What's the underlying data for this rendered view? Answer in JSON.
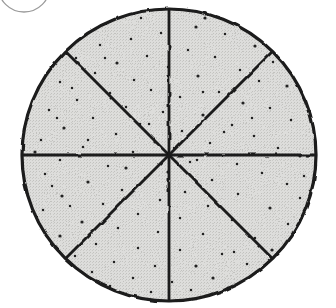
{
  "document": {
    "title": "Fraction Circle Diagram",
    "background_color": "#ffffff",
    "width": 336,
    "height": 308
  },
  "figure": {
    "name": "eighths-pie-circle",
    "description": "Hand-drawn circle divided into eight equal sectors, shaded with a stippled gray texture",
    "ink_color": "#1a1a1a",
    "fill_color": "#d9d9d6",
    "stipple_color": "#222222",
    "outline_width": 3.2,
    "divider_width": 2.8
  },
  "circle": {
    "name": "main-circle",
    "center_x": 169,
    "center_y": 155,
    "radius_x": 147,
    "radius_y": 146,
    "sector_count": 8,
    "sector_fraction": "1/8",
    "divider_angles_deg": [
      0,
      45,
      90,
      135
    ]
  },
  "partial_arc": {
    "name": "cropped-circle-arc",
    "description": "Faint partial circle outline cropped at the upper-left corner of the page",
    "center_x": 24,
    "center_y": -14,
    "radius": 26,
    "color": "#9a9a9a",
    "stroke_width": 1.3
  },
  "stipple_points": [
    [
      196,
      27
    ],
    [
      161,
      33
    ],
    [
      131,
      39
    ],
    [
      225,
      34
    ],
    [
      100,
      45
    ],
    [
      255,
      46
    ],
    [
      188,
      50
    ],
    [
      147,
      56
    ],
    [
      76,
      58
    ],
    [
      215,
      57
    ],
    [
      117,
      63
    ],
    [
      273,
      62
    ],
    [
      168,
      67
    ],
    [
      240,
      70
    ],
    [
      95,
      73
    ],
    [
      198,
      76
    ],
    [
      134,
      80
    ],
    [
      60,
      82
    ],
    [
      259,
      81
    ],
    [
      151,
      90
    ],
    [
      287,
      86
    ],
    [
      110,
      93
    ],
    [
      219,
      92
    ],
    [
      180,
      97
    ],
    [
      77,
      100
    ],
    [
      243,
      103
    ],
    [
      126,
      107
    ],
    [
      49,
      110
    ],
    [
      270,
      108
    ],
    [
      163,
      112
    ],
    [
      203,
      115
    ],
    [
      93,
      118
    ],
    [
      291,
      120
    ],
    [
      140,
      124
    ],
    [
      232,
      125
    ],
    [
      64,
      128
    ],
    [
      182,
      131
    ],
    [
      116,
      134
    ],
    [
      254,
      136
    ],
    [
      41,
      140
    ],
    [
      155,
      142
    ],
    [
      210,
      143
    ],
    [
      83,
      147
    ],
    [
      278,
      148
    ],
    [
      133,
      152
    ],
    [
      300,
      156
    ],
    [
      60,
      160
    ],
    [
      190,
      162
    ],
    [
      237,
      164
    ],
    [
      108,
      166
    ],
    [
      168,
      172
    ],
    [
      45,
      174
    ],
    [
      262,
      173
    ],
    [
      145,
      178
    ],
    [
      212,
      180
    ],
    [
      88,
      182
    ],
    [
      287,
      184
    ],
    [
      122,
      190
    ],
    [
      185,
      192
    ],
    [
      238,
      194
    ],
    [
      62,
      196
    ],
    [
      160,
      200
    ],
    [
      300,
      198
    ],
    [
      103,
      204
    ],
    [
      208,
      206
    ],
    [
      270,
      208
    ],
    [
      43,
      210
    ],
    [
      138,
      214
    ],
    [
      180,
      218
    ],
    [
      232,
      220
    ],
    [
      82,
      222
    ],
    [
      288,
      224
    ],
    [
      118,
      228
    ],
    [
      158,
      232
    ],
    [
      203,
      234
    ],
    [
      60,
      236
    ],
    [
      255,
      238
    ],
    [
      96,
      244
    ],
    [
      138,
      248
    ],
    [
      180,
      250
    ],
    [
      272,
      250
    ],
    [
      222,
      254
    ],
    [
      75,
      256
    ],
    [
      114,
      262
    ],
    [
      155,
      266
    ],
    [
      196,
      266
    ],
    [
      247,
      264
    ],
    [
      92,
      272
    ],
    [
      133,
      278
    ],
    [
      172,
      282
    ],
    [
      213,
      278
    ],
    [
      262,
      272
    ],
    [
      110,
      286
    ],
    [
      151,
      292
    ],
    [
      191,
      290
    ],
    [
      228,
      288
    ],
    [
      70,
      206
    ],
    [
      52,
      186
    ],
    [
      304,
      176
    ],
    [
      316,
      148
    ],
    [
      35,
      152
    ],
    [
      57,
      118
    ],
    [
      72,
      88
    ],
    [
      105,
      58
    ],
    [
      141,
      18
    ],
    [
      205,
      18
    ],
    [
      243,
      20
    ],
    [
      281,
      44
    ],
    [
      304,
      82
    ],
    [
      311,
      112
    ],
    [
      258,
      286
    ],
    [
      234,
      252
    ],
    [
      174,
      148
    ],
    [
      149,
      124
    ],
    [
      197,
      160
    ],
    [
      126,
      168
    ],
    [
      224,
      132
    ],
    [
      252,
      118
    ],
    [
      88,
      140
    ],
    [
      203,
      92
    ]
  ]
}
